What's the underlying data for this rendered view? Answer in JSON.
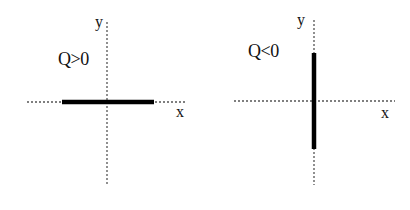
{
  "panels": [
    {
      "condition_label": "Q>0",
      "x_axis_label": "x",
      "y_axis_label": "y",
      "bar_orientation": "horizontal",
      "description": "Thick segment lies along the x-axis"
    },
    {
      "condition_label": "Q<0",
      "x_axis_label": "x",
      "y_axis_label": "y",
      "bar_orientation": "vertical",
      "description": "Thick segment lies along the y-axis"
    }
  ],
  "colors": {
    "background": "#ffffff",
    "bar": "#000000",
    "axis": "#555555",
    "text": "#111111"
  }
}
